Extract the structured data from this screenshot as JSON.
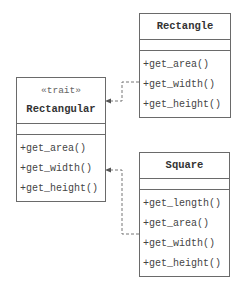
{
  "diagram": {
    "type": "uml-class-diagram",
    "classes": {
      "rectangle": {
        "name": "Rectangle",
        "methods": [
          "+get_area()",
          "+get_width()",
          "+get_height()"
        ]
      },
      "rectangular": {
        "stereotype": "«trait»",
        "name": "Rectangular",
        "methods": [
          "+get_area()",
          "+get_width()",
          "+get_height()"
        ]
      },
      "square": {
        "name": "Square",
        "methods": [
          "+get_length()",
          "+get_area()",
          "+get_width()",
          "+get_height()"
        ]
      }
    },
    "relations": [
      {
        "from": "Rectangle",
        "to": "Rectangular",
        "kind": "realization-dashed"
      },
      {
        "from": "Square",
        "to": "Rectangular",
        "kind": "realization-dashed"
      }
    ],
    "colors": {
      "border": "#6a6a6a",
      "text": "#333333",
      "background": "#ffffff"
    }
  }
}
